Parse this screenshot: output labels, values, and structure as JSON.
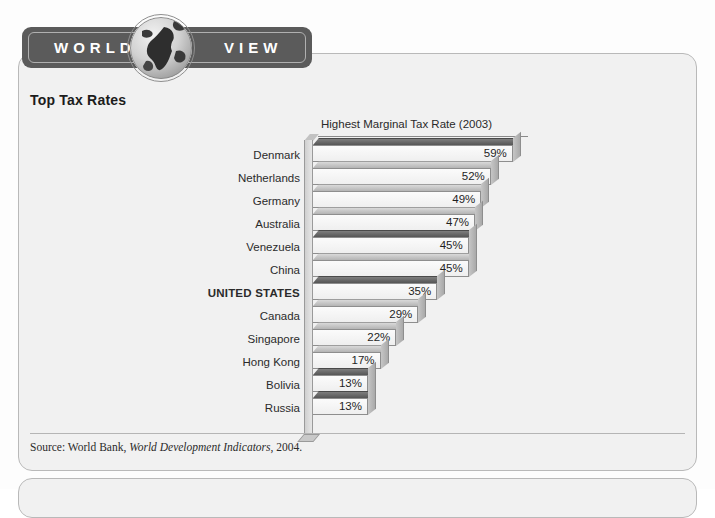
{
  "banner": {
    "word_left": "WORLD",
    "word_right": "VIEW",
    "globe_icon": "globe-icon"
  },
  "heading": "Top Tax Rates",
  "source": {
    "prefix": "Source: World Bank, ",
    "italic": "World Development Indicators",
    "suffix": ", 2004."
  },
  "chart_data": {
    "type": "bar",
    "orientation": "horizontal",
    "title": "Highest Marginal Tax Rate (2003)",
    "xlabel": "",
    "ylabel": "",
    "xlim": [
      0,
      62
    ],
    "grid": false,
    "legend": null,
    "value_suffix": "%",
    "highlight": "UNITED STATES",
    "categories": [
      "Denmark",
      "Netherlands",
      "Germany",
      "Australia",
      "Venezuela",
      "China",
      "UNITED STATES",
      "Canada",
      "Singapore",
      "Hong Kong",
      "Bolivia",
      "Russia"
    ],
    "values": [
      59,
      52,
      49,
      47,
      45,
      45,
      35,
      29,
      22,
      17,
      13,
      13
    ],
    "labels": [
      "59%",
      "52%",
      "49%",
      "47%",
      "45%",
      "45%",
      "35%",
      "29%",
      "22%",
      "17%",
      "13%",
      "13%"
    ],
    "bar_shades": [
      "dark",
      "light",
      "light",
      "light",
      "dark",
      "light",
      "dark",
      "light",
      "light",
      "light",
      "dark",
      "dark"
    ]
  },
  "colors": {
    "panel_bg": "#f1f1f1",
    "panel_border": "#b9b9b9",
    "banner_bg": "#5b5b5b",
    "banner_text": "#ffffff",
    "bar_front": "#fbfbfb",
    "bar_top_dark": "#565656",
    "bar_top_light": "#b4b4b4",
    "text": "#2b2b2b"
  }
}
